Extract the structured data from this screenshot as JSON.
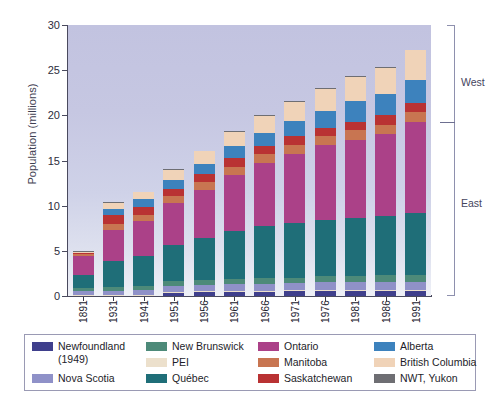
{
  "chart_data": {
    "type": "bar",
    "title": "",
    "subtitle": "",
    "xlabel": "",
    "ylabel": "Population (millions)",
    "ylim": [
      0,
      30
    ],
    "yticks": [
      0,
      5,
      10,
      15,
      20,
      25,
      30
    ],
    "grid": false,
    "stacked": true,
    "legend_position": "bottom",
    "categories": [
      "1891",
      "1931",
      "1941",
      "1951",
      "1956",
      "1961",
      "1966",
      "1971",
      "1976",
      "1981",
      "1986",
      "1991"
    ],
    "annotations": [
      {
        "text": "West",
        "position": "right-upper"
      },
      {
        "text": "East",
        "position": "right-lower"
      }
    ],
    "series": [
      {
        "name": "Newfoundland (1949)",
        "color": "#3f3f8c",
        "values": [
          0.0,
          0.0,
          0.0,
          0.36,
          0.42,
          0.46,
          0.49,
          0.52,
          0.56,
          0.57,
          0.57,
          0.57
        ]
      },
      {
        "name": "PEI",
        "color": "#ece0cc",
        "values": [
          0.11,
          0.09,
          0.1,
          0.1,
          0.1,
          0.11,
          0.11,
          0.11,
          0.12,
          0.12,
          0.13,
          0.13
        ]
      },
      {
        "name": "Nova Scotia",
        "color": "#8f91c8",
        "values": [
          0.45,
          0.51,
          0.58,
          0.64,
          0.69,
          0.74,
          0.76,
          0.79,
          0.83,
          0.85,
          0.87,
          0.9
        ]
      },
      {
        "name": "New Brunswick",
        "color": "#4d8a79",
        "values": [
          0.32,
          0.41,
          0.46,
          0.52,
          0.55,
          0.6,
          0.62,
          0.63,
          0.68,
          0.7,
          0.71,
          0.72
        ]
      },
      {
        "name": "Québec",
        "color": "#1f6e78",
        "values": [
          1.49,
          2.87,
          3.33,
          4.06,
          4.63,
          5.26,
          5.78,
          6.03,
          6.23,
          6.44,
          6.54,
          6.9
        ]
      },
      {
        "name": "Ontario",
        "color": "#ab4188",
        "values": [
          2.11,
          3.43,
          3.79,
          4.6,
          5.4,
          6.24,
          6.96,
          7.7,
          8.26,
          8.63,
          9.1,
          10.08
        ]
      },
      {
        "name": "Manitoba",
        "color": "#c87551",
        "values": [
          0.15,
          0.7,
          0.73,
          0.78,
          0.85,
          0.92,
          0.96,
          0.99,
          1.02,
          1.03,
          1.07,
          1.09
        ]
      },
      {
        "name": "Saskatchewan",
        "color": "#b93233",
        "values": [
          0.09,
          0.92,
          0.9,
          0.83,
          0.88,
          0.93,
          0.96,
          0.93,
          0.92,
          0.97,
          1.01,
          0.99
        ]
      },
      {
        "name": "Alberta",
        "color": "#3d82bd",
        "values": [
          0.1,
          0.73,
          0.8,
          0.94,
          1.12,
          1.33,
          1.46,
          1.63,
          1.84,
          2.24,
          2.37,
          2.55
        ]
      },
      {
        "name": "British Columbia",
        "color": "#f0d3b8",
        "values": [
          0.1,
          0.69,
          0.82,
          1.17,
          1.4,
          1.63,
          1.87,
          2.18,
          2.47,
          2.74,
          2.89,
          3.28
        ]
      },
      {
        "name": "NWT, Yukon",
        "color": "#6e6e73",
        "values": [
          0.02,
          0.02,
          0.02,
          0.03,
          0.03,
          0.04,
          0.05,
          0.05,
          0.06,
          0.07,
          0.07,
          0.08
        ]
      }
    ],
    "totals": [
      4.83,
      10.38,
      11.51,
      14.01,
      16.08,
      18.24,
      20.01,
      21.57,
      22.99,
      24.34,
      25.31,
      27.3
    ]
  },
  "axes": {
    "y_title": "Population (millions)",
    "y_ticks": [
      "0",
      "5",
      "10",
      "15",
      "20",
      "25",
      "30"
    ],
    "x_ticks": [
      "1891",
      "1931",
      "1941",
      "1951",
      "1956",
      "1961",
      "1966",
      "1971",
      "1976",
      "1981",
      "1986",
      "1991"
    ]
  },
  "side_brackets": {
    "upper": "West",
    "lower": "East"
  },
  "legend": {
    "entries": [
      {
        "label": "Newfoundland (1949)",
        "color": "#3f3f8c"
      },
      {
        "label": "New Brunswick",
        "color": "#4d8a79"
      },
      {
        "label": "Ontario",
        "color": "#ab4188"
      },
      {
        "label": "Alberta",
        "color": "#3d82bd"
      },
      {
        "label": "PEI",
        "color": "#ece0cc"
      },
      {
        "label": "Manitoba",
        "color": "#c87551"
      },
      {
        "label": "British Columbia",
        "color": "#f0d3b8"
      },
      {
        "label": "Nova Scotia",
        "color": "#8f91c8"
      },
      {
        "label": "Québec",
        "color": "#1f6e78"
      },
      {
        "label": "Saskatchewan",
        "color": "#b93233"
      },
      {
        "label": "NWT, Yukon",
        "color": "#6e6e73"
      }
    ]
  }
}
